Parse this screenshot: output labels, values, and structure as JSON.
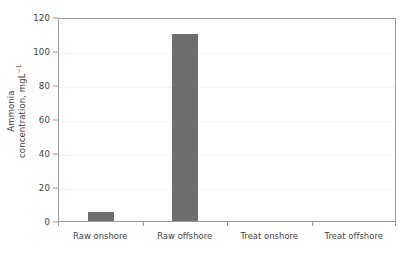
{
  "chart_data": {
    "type": "bar",
    "title": "",
    "subtitle": "",
    "xlabel": "",
    "ylabel_line1": "Ammonia",
    "ylabel_line2_pre": "concentration, mgL",
    "ylabel_line2_sup": "−1",
    "ylabel_plain": "Ammonia concentration, mgL−1",
    "categories": [
      "Raw onshore",
      "Raw offshore",
      "Treat onshore",
      "Treat offshore"
    ],
    "values": [
      5.5,
      110,
      0,
      0
    ],
    "series": [
      {
        "name": "Ammonia concentration",
        "values": [
          5.5,
          110,
          0,
          0
        ]
      }
    ],
    "ylim": [
      0,
      120
    ],
    "yticks": [
      0,
      20,
      40,
      60,
      80,
      100,
      120
    ],
    "ytick_labels": [
      "0",
      "20",
      "40",
      "60",
      "80",
      "100",
      "120"
    ],
    "grid": true,
    "grid_axis": "y",
    "legend": false,
    "legend_position": "none",
    "bar_color": "#6e6e6e",
    "axis_color": "#9a9a9a",
    "grid_color": "#f2f2f2",
    "text_color": "#3f3f3f",
    "background_color": "#ffffff"
  }
}
